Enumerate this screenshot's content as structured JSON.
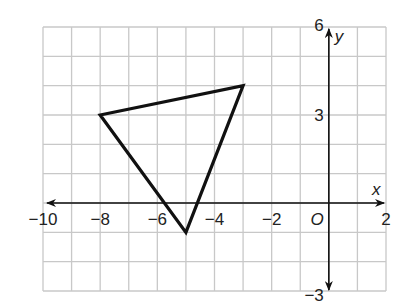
{
  "chart_data": {
    "type": "diagram",
    "title": "",
    "grid": true,
    "xlim": [
      -10,
      2
    ],
    "ylim": [
      -3,
      6
    ],
    "xlabel": "x",
    "ylabel": "y",
    "origin_label": "O",
    "x_tick_labels": [
      {
        "value": -10,
        "text": "−10"
      },
      {
        "value": -8,
        "text": "−8"
      },
      {
        "value": -6,
        "text": "−6"
      },
      {
        "value": -4,
        "text": "−4"
      },
      {
        "value": -2,
        "text": "−2"
      },
      {
        "value": 2,
        "text": "2"
      }
    ],
    "y_tick_labels": [
      {
        "value": 6,
        "text": "6"
      },
      {
        "value": 3,
        "text": "3"
      },
      {
        "value": -3,
        "text": "−3"
      }
    ],
    "shapes": [
      {
        "type": "triangle",
        "vertices": [
          [
            -8,
            3
          ],
          [
            -3,
            4
          ],
          [
            -5,
            -1
          ]
        ],
        "stroke": "#111111"
      }
    ]
  },
  "colors": {
    "grid": "#c8c8c8",
    "axis": "#111111",
    "shape": "#111111",
    "text": "#222222"
  }
}
